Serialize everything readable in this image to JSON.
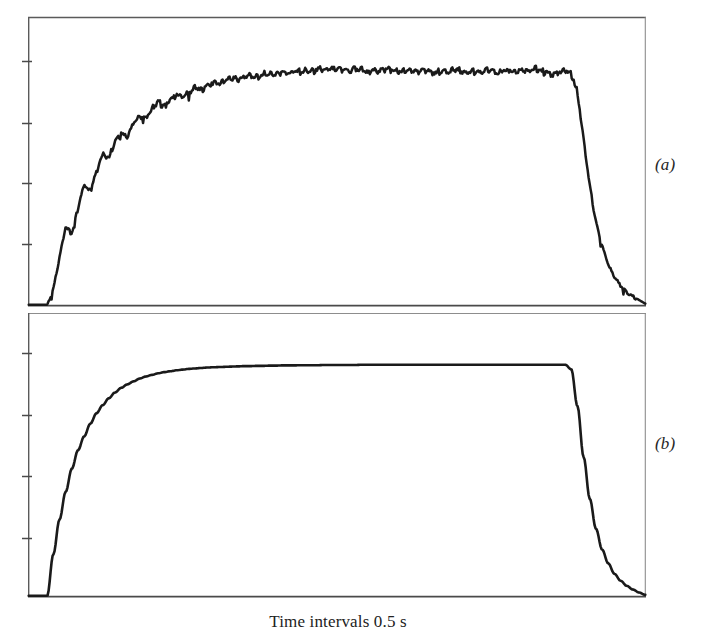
{
  "figure": {
    "background_color": "#ffffff",
    "ink_color": "#1a1a1a",
    "axis_color": "#3a3a3a",
    "caption": "Time intervals 0.5 s",
    "panel_label_a": "(a)",
    "panel_label_b": "(b)"
  },
  "chart_data": [
    {
      "type": "line",
      "id": "panel-a",
      "title": "(a)",
      "xlabel": "Time intervals 0.5 s",
      "ylabel": "",
      "grid": false,
      "legend": "none",
      "axis_ticks_left_count": 4,
      "xlim": [
        0,
        100
      ],
      "ylim": [
        0,
        1.12
      ],
      "description": "Noisy stepped rise to a fluctuating plateau, then smooth exponential decay to baseline",
      "x": [
        0,
        1,
        2,
        3,
        4,
        5,
        6,
        7,
        8,
        9,
        10,
        11,
        12,
        13,
        14,
        15,
        16,
        17,
        18,
        19,
        20,
        21,
        22,
        23,
        24,
        25,
        26,
        27,
        28,
        29,
        30,
        31,
        32,
        33,
        34,
        35,
        36,
        37,
        38,
        39,
        40,
        41,
        42,
        43,
        44,
        45,
        46,
        47,
        48,
        49,
        50,
        51,
        52,
        53,
        54,
        55,
        56,
        57,
        58,
        59,
        60,
        61,
        62,
        63,
        64,
        65,
        66,
        67,
        68,
        69,
        70,
        71,
        72,
        73,
        74,
        75,
        76,
        77,
        78,
        79,
        80,
        81,
        82,
        83,
        84,
        85,
        86,
        87,
        88,
        89,
        90,
        91,
        92,
        93,
        94,
        95,
        96,
        97,
        98,
        99,
        100
      ],
      "y": [
        0.0,
        0.0,
        0.0,
        0.0,
        0.07,
        0.2,
        0.33,
        0.3,
        0.41,
        0.51,
        0.48,
        0.57,
        0.64,
        0.62,
        0.69,
        0.73,
        0.71,
        0.77,
        0.8,
        0.79,
        0.83,
        0.86,
        0.84,
        0.87,
        0.89,
        0.88,
        0.9,
        0.92,
        0.91,
        0.93,
        0.94,
        0.935,
        0.95,
        0.96,
        0.955,
        0.965,
        0.97,
        0.965,
        0.975,
        0.98,
        0.975,
        0.985,
        0.98,
        0.99,
        0.985,
        0.995,
        0.99,
        1.0,
        0.995,
        1.0,
        0.995,
        1.0,
        0.99,
        1.0,
        0.995,
        0.985,
        0.995,
        0.99,
        1.0,
        0.995,
        0.985,
        0.995,
        0.99,
        0.985,
        0.995,
        0.99,
        0.98,
        0.99,
        0.985,
        0.995,
        0.99,
        0.98,
        0.99,
        0.985,
        0.995,
        0.99,
        0.98,
        0.99,
        0.995,
        0.985,
        0.995,
        0.99,
        1.0,
        0.99,
        0.985,
        0.975,
        0.985,
        0.99,
        0.98,
        0.9,
        0.7,
        0.5,
        0.35,
        0.25,
        0.17,
        0.12,
        0.08,
        0.055,
        0.035,
        0.02,
        0.005
      ],
      "plateau_level": 0.99,
      "rise_start_x": 3.8,
      "fall_start_x": 88,
      "noise_amplitude": 0.012
    },
    {
      "type": "line",
      "id": "panel-b",
      "title": "(b)",
      "xlabel": "Time intervals 0.5 s",
      "ylabel": "",
      "grid": false,
      "legend": "none",
      "axis_ticks_left_count": 4,
      "xlim": [
        0,
        100
      ],
      "ylim": [
        0,
        1.12
      ],
      "description": "Smooth exponential rise to a flat plateau, then sharp exponential decay to baseline",
      "x": [
        0,
        1,
        2,
        3,
        4,
        5,
        6,
        7,
        8,
        9,
        10,
        11,
        12,
        13,
        14,
        15,
        16,
        17,
        18,
        19,
        20,
        21,
        22,
        23,
        24,
        25,
        26,
        27,
        28,
        29,
        30,
        31,
        32,
        33,
        34,
        35,
        36,
        37,
        38,
        39,
        40,
        41,
        42,
        43,
        44,
        45,
        46,
        47,
        48,
        49,
        50,
        51,
        52,
        53,
        54,
        55,
        56,
        57,
        58,
        59,
        60,
        61,
        62,
        63,
        64,
        65,
        66,
        67,
        68,
        69,
        70,
        71,
        72,
        73,
        74,
        75,
        76,
        77,
        78,
        79,
        80,
        81,
        82,
        83,
        84,
        85,
        86,
        87,
        88,
        89,
        90,
        91,
        92,
        93,
        94,
        95,
        96,
        97,
        98,
        99,
        100
      ],
      "y": [
        0.0,
        0.0,
        0.0,
        0.0,
        0.18,
        0.33,
        0.45,
        0.55,
        0.63,
        0.69,
        0.745,
        0.79,
        0.825,
        0.855,
        0.88,
        0.9,
        0.915,
        0.928,
        0.94,
        0.949,
        0.956,
        0.963,
        0.968,
        0.972,
        0.976,
        0.979,
        0.982,
        0.984,
        0.986,
        0.988,
        0.989,
        0.99,
        0.991,
        0.992,
        0.993,
        0.994,
        0.994,
        0.995,
        0.995,
        0.996,
        0.996,
        0.997,
        0.997,
        0.997,
        0.998,
        0.998,
        0.998,
        0.998,
        0.999,
        0.999,
        0.999,
        0.999,
        0.999,
        0.999,
        1.0,
        1.0,
        1.0,
        1.0,
        1.0,
        1.0,
        1.0,
        1.0,
        1.0,
        1.0,
        1.0,
        1.0,
        1.0,
        1.0,
        1.0,
        1.0,
        1.0,
        1.0,
        1.0,
        1.0,
        1.0,
        1.0,
        1.0,
        1.0,
        1.0,
        1.0,
        1.0,
        1.0,
        1.0,
        1.0,
        1.0,
        1.0,
        1.0,
        1.0,
        0.98,
        0.82,
        0.6,
        0.42,
        0.29,
        0.2,
        0.14,
        0.095,
        0.065,
        0.043,
        0.027,
        0.014,
        0.004
      ],
      "plateau_level": 1.0,
      "rise_start_x": 3.8,
      "fall_start_x": 88,
      "noise_amplitude": 0.0
    }
  ]
}
